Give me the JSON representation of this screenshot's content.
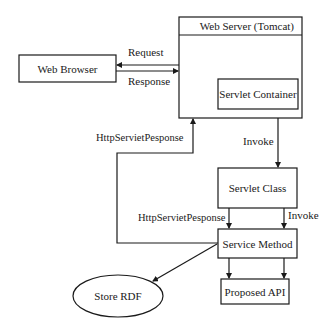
{
  "diagram": {
    "nodes": {
      "web_server": "Web Server (Tomcat)",
      "web_browser": "Web Browser",
      "servlet_container": "Servlet Container",
      "servlet_class": "Servlet Class",
      "service_method": "Service Method",
      "proposed_api": "Proposed API",
      "store_rdf": "Store RDF"
    },
    "edges": {
      "request": "Request",
      "response": "Response",
      "http_response_up": "HttpServietPesponse",
      "invoke_top": "Invoke",
      "http_response_mid": "HttpServietPesponse",
      "invoke_mid": "Invoke"
    },
    "colors": {
      "stroke": "#1a1a1a",
      "background": "#ffffff"
    }
  }
}
